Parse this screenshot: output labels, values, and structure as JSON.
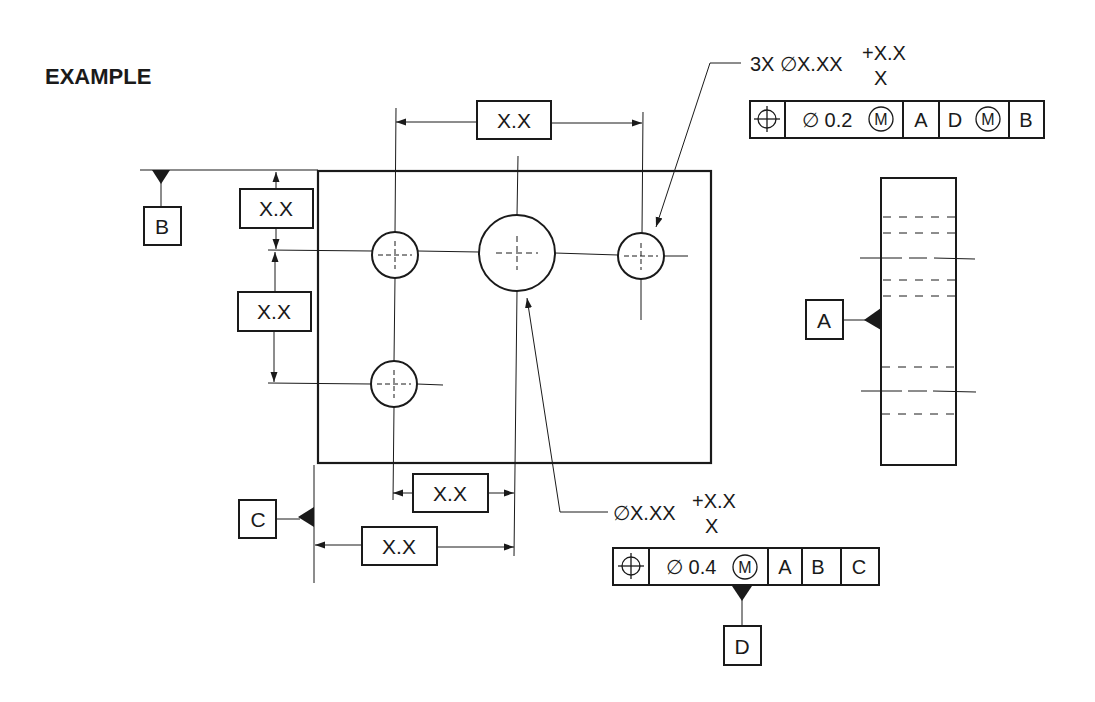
{
  "title": "EXAMPLE",
  "dimensions": {
    "top_horizontal": "X.X",
    "left_upper_vertical": "X.X",
    "left_lower_vertical": "X.X",
    "bottom_upper_horizontal": "X.X",
    "bottom_lower_horizontal": "X.X"
  },
  "datums": {
    "B": "B",
    "C": "C",
    "A": "A",
    "D": "D"
  },
  "hole_callout_3x": {
    "note_main": "3X ∅X.XX",
    "tol_upper": "+X.X",
    "tol_lower": "X",
    "fcf": {
      "symbol": "position-icon",
      "tolerance": "∅ 0.2",
      "modifier": "M",
      "datum1": "A",
      "datum2": "D",
      "datum2_modifier": "M",
      "datum3": "B"
    }
  },
  "hole_callout_large": {
    "note_main": "∅X.XX",
    "tol_upper": "+X.X",
    "tol_lower": "X",
    "fcf": {
      "symbol": "position-icon",
      "tolerance": "∅ 0.4",
      "modifier": "M",
      "datum1": "A",
      "datum2": "B",
      "datum3": "C"
    }
  }
}
